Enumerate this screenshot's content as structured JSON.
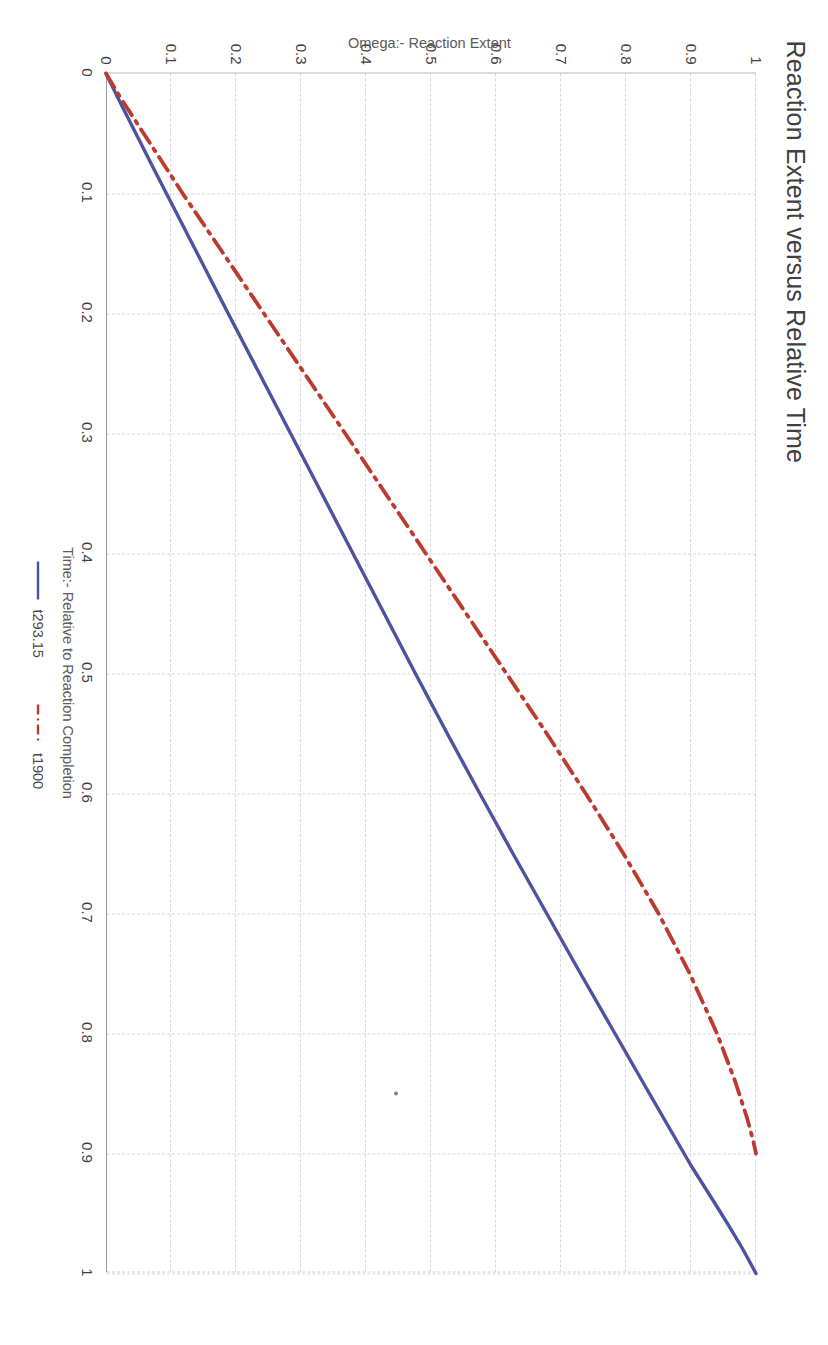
{
  "chart_data": {
    "type": "line",
    "title": "Reaction Extent versus Relative Time",
    "xlabel": "Time:- Relative to Reaction Completion",
    "ylabel": "Omega:- Reaction Extent",
    "xlim": [
      0,
      1
    ],
    "ylim": [
      0,
      1
    ],
    "xticks": [
      0,
      0.1,
      0.2,
      0.3,
      0.4,
      0.5,
      0.6,
      0.7,
      0.8,
      0.9,
      1
    ],
    "xticklabels": [
      "0",
      "0.1",
      "0.2",
      "0.3",
      "0.4",
      "0.5",
      "0.6",
      "0.7",
      "0.8",
      "0.9",
      "1"
    ],
    "yticks": [
      0,
      0.1,
      0.2,
      0.3,
      0.4,
      0.5,
      0.6,
      0.7,
      0.8,
      0.9,
      1
    ],
    "yticklabels": [
      "0",
      "0.1",
      "0.2",
      "0.3",
      "0.4",
      "0.5",
      "0.6",
      "0.7",
      "0.8",
      "0.9",
      "1"
    ],
    "grid": true,
    "legend_position": "bottom",
    "rotation_deg": 90,
    "series": [
      {
        "name": "t293.15",
        "color": "#4a54a0",
        "style": "solid",
        "x": [
          0,
          0.02,
          0.05,
          0.08,
          0.12,
          0.16,
          0.2,
          0.25,
          0.3,
          0.35,
          0.4,
          0.45,
          0.5,
          0.55,
          0.6,
          0.65,
          0.7,
          0.75,
          0.8,
          0.85,
          0.88,
          0.91,
          0.94,
          0.96,
          0.98,
          1.0
        ],
        "y": [
          0,
          0.018,
          0.046,
          0.074,
          0.112,
          0.15,
          0.188,
          0.236,
          0.284,
          0.332,
          0.38,
          0.428,
          0.476,
          0.525,
          0.575,
          0.626,
          0.678,
          0.73,
          0.783,
          0.836,
          0.868,
          0.9,
          0.935,
          0.958,
          0.98,
          1.0
        ]
      },
      {
        "name": "t1900",
        "color": "#bc3b2e",
        "style": "dashdot",
        "x": [
          0,
          0.02,
          0.04,
          0.07,
          0.1,
          0.14,
          0.18,
          0.22,
          0.26,
          0.3,
          0.35,
          0.4,
          0.45,
          0.5,
          0.55,
          0.6,
          0.65,
          0.7,
          0.75,
          0.8,
          0.84,
          0.87,
          0.89,
          0.9
        ],
        "y": [
          0,
          0.022,
          0.046,
          0.082,
          0.118,
          0.168,
          0.218,
          0.268,
          0.318,
          0.368,
          0.43,
          0.492,
          0.554,
          0.616,
          0.678,
          0.738,
          0.796,
          0.85,
          0.898,
          0.94,
          0.968,
          0.986,
          0.996,
          1.0
        ]
      }
    ]
  },
  "legend": {
    "items": [
      {
        "label": "t293.15"
      },
      {
        "label": "t1900"
      }
    ]
  }
}
